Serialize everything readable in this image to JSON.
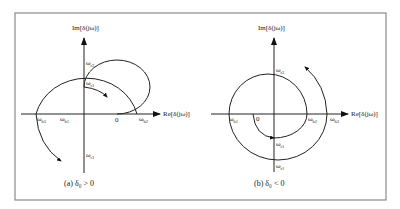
{
  "figure": {
    "panels": [
      {
        "id": "a",
        "caption": "(a)  δ₀ > 0",
        "im_axis_label": "Im[δ(jω)]",
        "re_axis_label": "Re[δ(jω)]",
        "origin_label": "0",
        "labels": {
          "outer_top": "ωr2",
          "inner_top": "ωr1",
          "left_outer": "ωh3",
          "left_inner": "ωh1",
          "right_outer": "ωh2",
          "bottom": "ωr1"
        }
      },
      {
        "id": "b",
        "caption": "(b)  δ₀ < 0",
        "im_axis_label": "Im[δ(jω)]",
        "re_axis_label": "Re[δ(jω)]",
        "origin_label": "0",
        "labels": {
          "outer_top": "ωr2",
          "left_outer": "ωh1",
          "right_inner": "ωh2",
          "right_outer": "ωh3",
          "inner_bottom": "ωr1",
          "outer_bottom": "ωr1"
        }
      }
    ]
  }
}
